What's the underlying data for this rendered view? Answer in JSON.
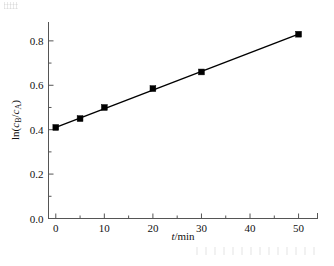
{
  "figure": {
    "background": "#ffffff",
    "axis_color": "#555555",
    "data_color": "#000000"
  },
  "axes": {
    "x": {
      "title_main": "t",
      "title_unit": "/min",
      "tick_labels": [
        "0",
        "10",
        "20",
        "30",
        "40",
        "50"
      ],
      "tick_values": [
        0,
        10,
        20,
        30,
        40,
        50
      ],
      "minor_tick_values": [
        5,
        15,
        25,
        35,
        45
      ],
      "range": [
        -1.5,
        54
      ]
    },
    "y": {
      "title_prefix": "ln(",
      "title_c1": "c",
      "title_c1_sub": "B",
      "title_slash": "/",
      "title_c2": "c",
      "title_c2_sub": "A",
      "title_suffix": ")",
      "tick_labels": [
        "0.0",
        "0.2",
        "0.4",
        "0.6",
        "0.8"
      ],
      "tick_values": [
        0.0,
        0.2,
        0.4,
        0.6,
        0.8
      ],
      "minor_tick_values": [
        0.1,
        0.3,
        0.5,
        0.7
      ],
      "range": [
        0.0,
        0.885
      ]
    }
  },
  "chart_data": {
    "type": "scatter",
    "title": "",
    "xlabel": "t/min",
    "ylabel": "ln(cB/cA)",
    "xlim": [
      -1.5,
      54
    ],
    "ylim": [
      0.0,
      0.885
    ],
    "grid": false,
    "legend": "none",
    "marker": "filled-square",
    "series": [
      {
        "name": "ln(cB/cA) vs t",
        "x": [
          0,
          5,
          10,
          20,
          30,
          50
        ],
        "y": [
          0.41,
          0.45,
          0.5,
          0.585,
          0.66,
          0.83
        ],
        "fit_line": {
          "type": "linear",
          "x_start": 0,
          "x_end": 50,
          "y_start": 0.41,
          "y_end": 0.83,
          "slope": 0.0084,
          "intercept": 0.41
        }
      }
    ]
  }
}
